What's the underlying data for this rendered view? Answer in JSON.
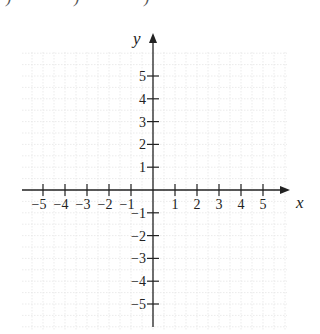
{
  "top_fragments": [
    ")",
    ")",
    ")"
  ],
  "plane": {
    "x_axis_label": "x",
    "y_axis_label": "y",
    "x_ticks": [
      {
        "value": -5,
        "label": "−5"
      },
      {
        "value": -4,
        "label": "−4"
      },
      {
        "value": -3,
        "label": "−3"
      },
      {
        "value": -2,
        "label": "−2"
      },
      {
        "value": -1,
        "label": "−1"
      },
      {
        "value": 1,
        "label": "1"
      },
      {
        "value": 2,
        "label": "2"
      },
      {
        "value": 3,
        "label": "3"
      },
      {
        "value": 4,
        "label": "4"
      },
      {
        "value": 5,
        "label": "5"
      }
    ],
    "y_ticks": [
      {
        "value": 5,
        "label": "5"
      },
      {
        "value": 4,
        "label": "4"
      },
      {
        "value": 3,
        "label": "3"
      },
      {
        "value": 2,
        "label": "2"
      },
      {
        "value": 1,
        "label": "1"
      },
      {
        "value": -1,
        "label": "−1"
      },
      {
        "value": -2,
        "label": "−2"
      },
      {
        "value": -3,
        "label": "−3"
      },
      {
        "value": -4,
        "label": "−4"
      },
      {
        "value": -5,
        "label": "−5"
      }
    ],
    "x_range": [
      -6,
      6
    ],
    "y_range": [
      -6,
      6
    ],
    "grid": true,
    "colors": {
      "axis": "#222222",
      "grid": "#e6e6e6"
    }
  }
}
